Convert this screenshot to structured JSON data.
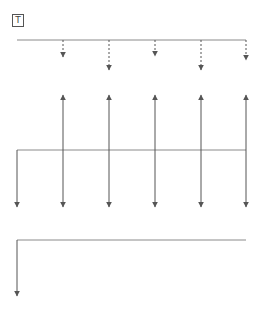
{
  "label": {
    "text": "T"
  },
  "colors": {
    "line": "#8a8a8a",
    "arrow": "#555555"
  },
  "top_line": {
    "y": 40,
    "x1": 17,
    "x2": 246
  },
  "dashed_arrows": [
    {
      "x": 63,
      "y1": 40,
      "y2": 57
    },
    {
      "x": 109,
      "y1": 40,
      "y2": 70
    },
    {
      "x": 155,
      "y1": 40,
      "y2": 56
    },
    {
      "x": 201,
      "y1": 40,
      "y2": 70
    },
    {
      "x": 246,
      "y1": 40,
      "y2": 60
    }
  ],
  "middle_line": {
    "y": 150,
    "x1": 17,
    "x2": 246
  },
  "middle_down_arrow": {
    "x": 17,
    "y1": 150,
    "y2": 207
  },
  "double_arrows": [
    {
      "x": 63,
      "y1": 95,
      "y2": 207
    },
    {
      "x": 109,
      "y1": 95,
      "y2": 207
    },
    {
      "x": 155,
      "y1": 95,
      "y2": 207
    },
    {
      "x": 201,
      "y1": 95,
      "y2": 207
    },
    {
      "x": 246,
      "y1": 95,
      "y2": 207
    }
  ],
  "bottom_line": {
    "y": 240,
    "x1": 17,
    "x2": 246
  },
  "bottom_down_arrow": {
    "x": 17,
    "y1": 240,
    "y2": 296
  }
}
